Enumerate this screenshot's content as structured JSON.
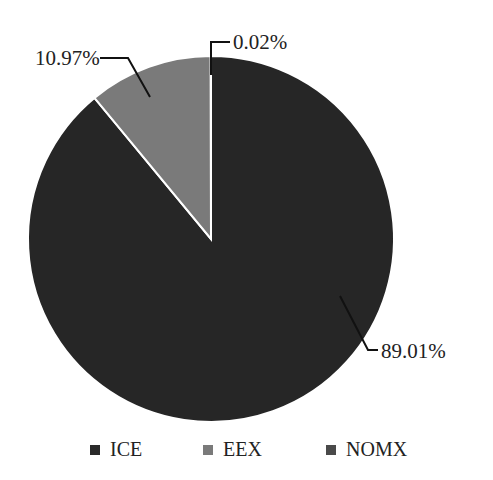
{
  "chart_data": {
    "type": "pie",
    "title": "",
    "categories": [
      "ICE",
      "EEX",
      "NOMX"
    ],
    "values": [
      89.01,
      10.97,
      0.02
    ],
    "labels": [
      "89.01%",
      "10.97%",
      "0.02%"
    ],
    "colors": [
      "#262626",
      "#7a7a7a",
      "#4a4a4a"
    ],
    "legend_position": "bottom",
    "start_angle": "12 o'clock, clockwise"
  },
  "legend": [
    {
      "label": "ICE",
      "color": "#2a2a2a"
    },
    {
      "label": "EEX",
      "color": "#7a7a7a"
    },
    {
      "label": "NOMX",
      "color": "#4a4a4a"
    }
  ]
}
